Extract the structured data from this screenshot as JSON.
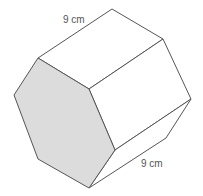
{
  "diagram": {
    "shape": "hexagonal prism",
    "labels": {
      "top_edge": "9 cm",
      "bottom_edge": "9 cm"
    },
    "colors": {
      "front_face": "#dcdcdc",
      "stroke": "#555555",
      "label": "#555555"
    }
  }
}
